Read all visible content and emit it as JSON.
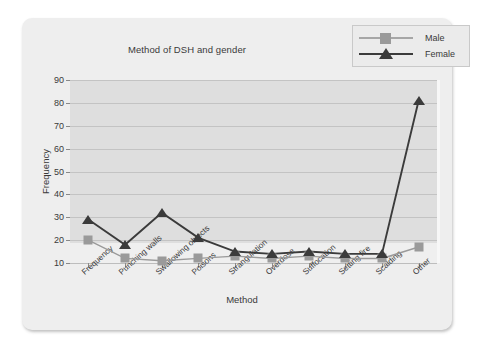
{
  "chart_data": {
    "type": "line",
    "title": "Method of DSH and gender",
    "xlabel": "Method",
    "ylabel": "Frequency",
    "ylim": [
      10,
      90
    ],
    "ytick_labels": [
      "90",
      "80",
      "70",
      "60",
      "50",
      "40",
      "30",
      "20",
      "10"
    ],
    "ytick_values": [
      90,
      80,
      70,
      60,
      50,
      40,
      30,
      20,
      10
    ],
    "grid": true,
    "legend_position": "top-right",
    "categories": [
      "Frequency",
      "Punching walls",
      "Swallowing objects",
      "Poisons",
      "Strangulation",
      "Overdose",
      "Suffocation",
      "Setting fire",
      "Scalding",
      "Other"
    ],
    "series": [
      {
        "name": "Male",
        "marker": "square",
        "color": "#9a9a9a",
        "values": [
          20,
          12,
          11,
          12,
          13,
          12,
          13,
          12,
          12,
          17
        ]
      },
      {
        "name": "Female",
        "marker": "triangle",
        "color": "#3b3b3b",
        "values": [
          29,
          18,
          32,
          21,
          15,
          14,
          15,
          14,
          14,
          81
        ]
      }
    ]
  },
  "legend": {
    "items": [
      {
        "label": "Male"
      },
      {
        "label": "Female"
      }
    ]
  }
}
